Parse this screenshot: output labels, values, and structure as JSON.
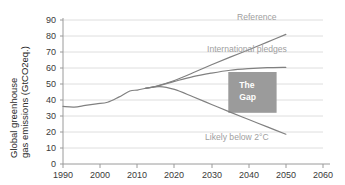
{
  "chart_data": {
    "type": "line",
    "title": "",
    "xlabel": "",
    "ylabel": "Global greenhouse gas emissions (GtCO2eq.)",
    "ylabel_line1": "Global greenhouse",
    "ylabel_line2": "gas emissions (GtCO2eq.)",
    "xlim": [
      1990,
      2060
    ],
    "ylim": [
      0,
      90
    ],
    "xticks": [
      1990,
      2000,
      2010,
      2020,
      2030,
      2040,
      2050,
      2060
    ],
    "yticks": [
      0,
      10,
      20,
      30,
      40,
      50,
      60,
      70,
      80,
      90
    ],
    "grid": "horizontal",
    "legend": "inline-labels",
    "series": [
      {
        "name": "Historical",
        "label": "",
        "color": "#808080",
        "x": [
          1990,
          1993,
          1996,
          1999,
          2002,
          2005,
          2008,
          2010,
          2012
        ],
        "values": [
          36.0,
          35.6,
          36.6,
          37.6,
          38.6,
          41.8,
          45.6,
          46.2,
          47.2
        ]
      },
      {
        "name": "Reference",
        "label": "Reference",
        "color": "#808080",
        "x": [
          2012,
          2015,
          2020,
          2025,
          2030,
          2035,
          2040,
          2045,
          2050
        ],
        "values": [
          47.2,
          48.6,
          52.2,
          57.0,
          62.0,
          66.8,
          71.4,
          76.2,
          81.0
        ]
      },
      {
        "name": "International pledges",
        "label": "International pledges",
        "color": "#808080",
        "x": [
          2012,
          2015,
          2020,
          2025,
          2030,
          2035,
          2040,
          2045,
          2050
        ],
        "values": [
          47.2,
          48.4,
          51.6,
          54.6,
          56.8,
          58.6,
          59.6,
          60.2,
          60.4
        ]
      },
      {
        "name": "Likely below 2C",
        "label": "Likely below 2°C",
        "color": "#808080",
        "x": [
          2012,
          2016,
          2020,
          2025,
          2030,
          2035,
          2040,
          2045,
          2050
        ],
        "values": [
          47.2,
          48.4,
          46.6,
          42.0,
          37.2,
          32.4,
          27.8,
          23.2,
          18.6
        ]
      }
    ],
    "annotations": [
      {
        "name": "the-gap-box",
        "text_line1": "The",
        "text_line2": "Gap",
        "text": "The Gap",
        "color": "#9b9b9b",
        "text_color": "#ffffff",
        "x_range": [
          2034.5,
          2047.5
        ],
        "y_range": [
          32.0,
          57.5
        ]
      }
    ]
  },
  "colors": {
    "line": "#808080",
    "gridline": "#dedede",
    "axis": "#9a9a9a",
    "label_text": "#a0a0a0",
    "tick_text": "#3a3a3a",
    "gap_box": "#9b9b9b",
    "background": "#ffffff"
  }
}
